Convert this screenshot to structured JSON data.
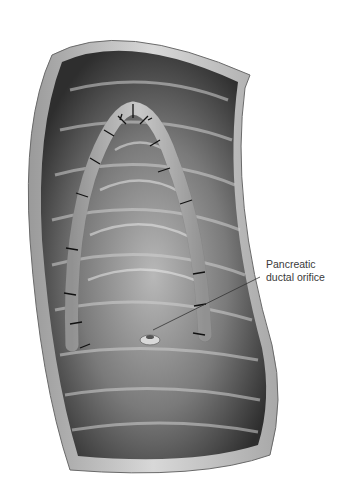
{
  "figure": {
    "annotations": [
      {
        "line1": "Pancreatic",
        "line2": "ductal orifice",
        "target": "pancreatic-ductal-orifice"
      }
    ]
  }
}
